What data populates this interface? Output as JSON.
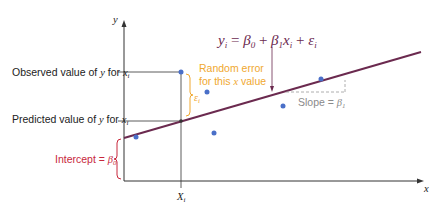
{
  "diagram": {
    "type": "simple-linear-regression-model",
    "axes": {
      "y_label": "y",
      "x_label": "x"
    },
    "equation": {
      "lhs": "y",
      "lhs_sub": "i",
      "eq": " = ",
      "b0": "β",
      "b0_sub": "0",
      "plus1": " + ",
      "b1": "β",
      "b1_sub": "1",
      "x": "x",
      "x_sub": "i",
      "plus2": " + ",
      "eps": "ε",
      "eps_sub": "i"
    },
    "labels": {
      "observed": {
        "text": "Observed value of ",
        "var": "y",
        "mid": " for ",
        "x": "x",
        "sub": "i"
      },
      "predicted": {
        "text": "Predicted value of ",
        "var": "y",
        "mid": " for ",
        "x": "x",
        "sub": "i"
      },
      "random_error_line1": "Random error",
      "random_error_line2_a": "for this ",
      "random_error_line2_x": "x",
      "random_error_line2_b": " value",
      "epsilon": "ε",
      "epsilon_sub": "i",
      "slope_text": "Slope = ",
      "slope_beta": "β",
      "slope_sub": "1",
      "intercept_text": "Intercept = ",
      "intercept_beta": "β",
      "intercept_sub": "0",
      "xi": "X",
      "xi_sub": "i"
    },
    "colors": {
      "line": "#6b2a4f",
      "points": "#4a6fc8",
      "error": "#f0a830",
      "intercept": "#c8283c",
      "slope": "#8a8a8a",
      "axis": "#333333"
    },
    "points": [
      {
        "x": 136,
        "y": 137
      },
      {
        "x": 181,
        "y": 72
      },
      {
        "x": 207,
        "y": 92
      },
      {
        "x": 214,
        "y": 133
      },
      {
        "x": 283,
        "y": 106
      },
      {
        "x": 321,
        "y": 79
      }
    ]
  }
}
